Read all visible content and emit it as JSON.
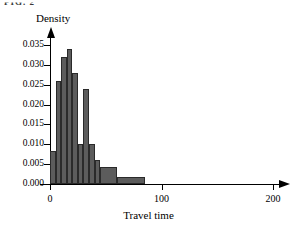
{
  "figure": {
    "caption_fragment": "FIG. 2",
    "ylabel": "Density",
    "xlabel": "Travel time"
  },
  "chart_data": {
    "type": "bar",
    "title": "",
    "subtitle": "",
    "xlabel": "Travel time",
    "ylabel": "Density",
    "xlim": [
      0,
      200
    ],
    "ylim": [
      0.0,
      0.035
    ],
    "grid": false,
    "legend": null,
    "bin_edges": [
      0,
      5,
      10,
      15,
      20,
      25,
      30,
      35,
      40,
      45,
      60,
      85
    ],
    "categories": [
      "0-5",
      "5-10",
      "10-15",
      "15-20",
      "20-25",
      "25-30",
      "30-35",
      "35-40",
      "40-45",
      "45-60",
      "60-85"
    ],
    "values": [
      0.0082,
      0.026,
      0.032,
      0.034,
      0.028,
      0.0102,
      0.024,
      0.0102,
      0.006,
      0.0042,
      0.0018
    ],
    "xticks": [
      0,
      100,
      200
    ],
    "xtick_labels": [
      "0",
      "100",
      "200"
    ],
    "yticks": [
      0.0,
      0.005,
      0.01,
      0.015,
      0.02,
      0.025,
      0.03,
      0.035
    ],
    "ytick_labels": [
      "0.000",
      "0.005",
      "0.010",
      "0.015",
      "0.020",
      "0.025",
      "0.030",
      "0.035"
    ],
    "bar_color": "#5c5c5c",
    "bar_edge_color": "#2a2a2a",
    "axis_color": "#000000"
  }
}
